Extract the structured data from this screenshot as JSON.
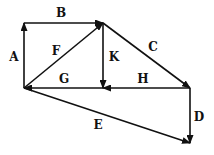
{
  "diagram": {
    "type": "vector-diagram",
    "color": "#111111",
    "vectors": [
      {
        "label": "A",
        "from": [
          24,
          88
        ],
        "to": [
          24,
          23
        ],
        "label_pos": [
          14,
          57
        ]
      },
      {
        "label": "B",
        "from": [
          24,
          23
        ],
        "to": [
          103,
          23
        ],
        "label_pos": [
          61,
          13
        ]
      },
      {
        "label": "C",
        "from": [
          103,
          23
        ],
        "to": [
          190,
          88
        ],
        "label_pos": [
          153,
          47
        ]
      },
      {
        "label": "D",
        "from": [
          190,
          88
        ],
        "to": [
          190,
          143
        ],
        "label_pos": [
          199,
          117
        ]
      },
      {
        "label": "E",
        "from": [
          24,
          88
        ],
        "to": [
          190,
          143
        ],
        "label_pos": [
          98,
          125
        ]
      },
      {
        "label": "F",
        "from": [
          24,
          88
        ],
        "to": [
          103,
          23
        ],
        "label_pos": [
          56,
          51
        ]
      },
      {
        "label": "G",
        "from": [
          103,
          88
        ],
        "to": [
          24,
          88
        ],
        "label_pos": [
          64,
          79
        ]
      },
      {
        "label": "H",
        "from": [
          190,
          88
        ],
        "to": [
          103,
          88
        ],
        "label_pos": [
          143,
          79
        ]
      },
      {
        "label": "K",
        "from": [
          103,
          23
        ],
        "to": [
          103,
          88
        ],
        "label_pos": [
          114,
          57
        ]
      }
    ]
  }
}
